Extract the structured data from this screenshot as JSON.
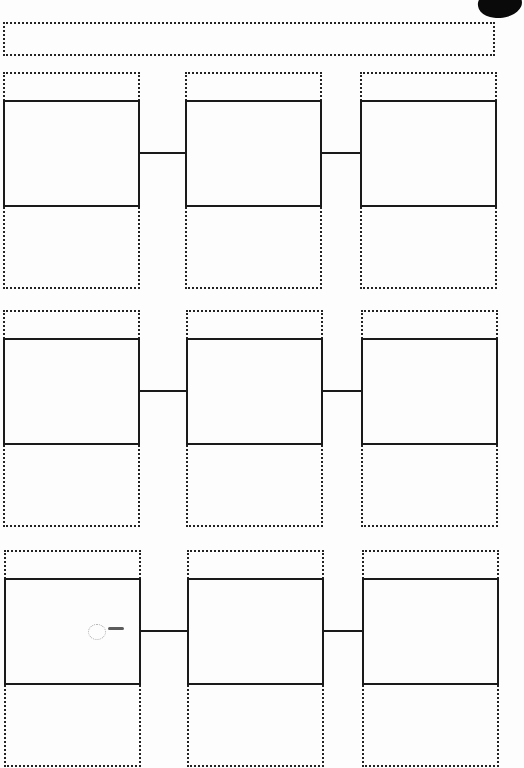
{
  "document": {
    "type": "storyboard-template",
    "title_field": "",
    "rows": [
      {
        "panels": [
          {
            "caption_top": "",
            "image": "",
            "caption_bottom": ""
          },
          {
            "caption_top": "",
            "image": "",
            "caption_bottom": ""
          },
          {
            "caption_top": "",
            "image": "",
            "caption_bottom": ""
          }
        ]
      },
      {
        "panels": [
          {
            "caption_top": "",
            "image": "",
            "caption_bottom": ""
          },
          {
            "caption_top": "",
            "image": "",
            "caption_bottom": ""
          },
          {
            "caption_top": "",
            "image": "",
            "caption_bottom": ""
          }
        ]
      },
      {
        "panels": [
          {
            "caption_top": "",
            "image": "",
            "caption_bottom": ""
          },
          {
            "caption_top": "",
            "image": "",
            "caption_bottom": ""
          },
          {
            "caption_top": "",
            "image": "",
            "caption_bottom": ""
          }
        ]
      }
    ],
    "colors": {
      "line": "#1a1a1a",
      "paper": "#fdfdfd"
    }
  }
}
